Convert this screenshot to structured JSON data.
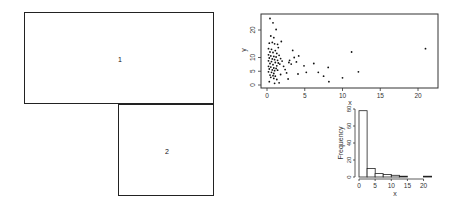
{
  "layout_panels": [
    {
      "label": "1",
      "x": 24,
      "y": 12,
      "w": 190,
      "h": 92
    },
    {
      "label": "2",
      "x": 118,
      "y": 104,
      "w": 96,
      "h": 92
    }
  ],
  "chart_data": [
    {
      "type": "scatter",
      "title": "",
      "xlabel": "x",
      "ylabel": "y",
      "xlim": [
        0,
        21
      ],
      "ylim": [
        0,
        24
      ],
      "xticks": [
        "0",
        "5",
        "10",
        "15",
        "20"
      ],
      "yticks": [
        "0",
        "5",
        "10",
        "20"
      ],
      "grid": false,
      "points": [
        [
          0.4,
          24.2
        ],
        [
          0.8,
          22.6
        ],
        [
          1.2,
          20.2
        ],
        [
          0.5,
          17.8
        ],
        [
          0.9,
          17.2
        ],
        [
          0.3,
          15.2
        ],
        [
          0.7,
          15.5
        ],
        [
          1.0,
          15.0
        ],
        [
          1.4,
          14.8
        ],
        [
          1.9,
          15.8
        ],
        [
          0.2,
          13.2
        ],
        [
          0.6,
          13.0
        ],
        [
          1.1,
          12.5
        ],
        [
          1.5,
          13.6
        ],
        [
          0.4,
          12.0
        ],
        [
          0.8,
          11.8
        ],
        [
          1.3,
          11.5
        ],
        [
          0.2,
          11.0
        ],
        [
          0.5,
          10.6
        ],
        [
          0.9,
          10.4
        ],
        [
          1.2,
          10.2
        ],
        [
          1.6,
          10.8
        ],
        [
          0.3,
          9.8
        ],
        [
          0.7,
          9.5
        ],
        [
          1.0,
          9.2
        ],
        [
          1.4,
          9.0
        ],
        [
          1.8,
          9.6
        ],
        [
          0.2,
          8.8
        ],
        [
          0.6,
          8.5
        ],
        [
          1.1,
          8.2
        ],
        [
          1.5,
          8.0
        ],
        [
          2.0,
          8.7
        ],
        [
          0.4,
          7.8
        ],
        [
          0.8,
          7.4
        ],
        [
          1.3,
          7.0
        ],
        [
          1.7,
          7.6
        ],
        [
          0.2,
          6.8
        ],
        [
          0.5,
          6.5
        ],
        [
          0.9,
          6.2
        ],
        [
          1.2,
          6.0
        ],
        [
          0.3,
          5.8
        ],
        [
          0.7,
          5.5
        ],
        [
          1.0,
          5.2
        ],
        [
          1.4,
          5.4
        ],
        [
          0.2,
          4.8
        ],
        [
          0.6,
          4.6
        ],
        [
          0.9,
          4.2
        ],
        [
          0.4,
          3.6
        ],
        [
          0.8,
          3.4
        ],
        [
          1.1,
          3.2
        ],
        [
          0.5,
          2.8
        ],
        [
          0.9,
          2.4
        ],
        [
          1.3,
          2.0
        ],
        [
          0.3,
          1.2
        ],
        [
          1.6,
          0.8
        ],
        [
          2.2,
          6.8
        ],
        [
          2.6,
          4.4
        ],
        [
          2.9,
          8.2
        ],
        [
          3.2,
          7.6
        ],
        [
          3.4,
          12.6
        ],
        [
          3.6,
          10.0
        ],
        [
          3.9,
          8.4
        ],
        [
          4.1,
          4.0
        ],
        [
          4.2,
          10.6
        ],
        [
          4.9,
          7.0
        ],
        [
          5.2,
          4.6
        ],
        [
          6.2,
          7.8
        ],
        [
          6.8,
          4.6
        ],
        [
          7.5,
          3.2
        ],
        [
          8.1,
          6.4
        ],
        [
          8.2,
          1.2
        ],
        [
          10.0,
          2.6
        ],
        [
          11.2,
          12.0
        ],
        [
          12.1,
          4.8
        ],
        [
          21.0,
          13.2
        ],
        [
          2.4,
          5.6
        ],
        [
          1.8,
          3.8
        ],
        [
          2.8,
          2.2
        ],
        [
          3.0,
          9.0
        ],
        [
          1.0,
          0.6
        ]
      ]
    },
    {
      "type": "bar",
      "subtype": "histogram",
      "title": "",
      "xlabel": "x",
      "ylabel": "Frequency",
      "xlim": [
        0,
        22
      ],
      "ylim": [
        0,
        80
      ],
      "xticks": [
        "0",
        "5",
        "10",
        "15",
        "20"
      ],
      "yticks": [
        "0",
        "20",
        "40",
        "60",
        "80"
      ],
      "bin_width": 2.5,
      "categories": [
        "0-2.5",
        "2.5-5",
        "5-7.5",
        "7.5-10",
        "10-12.5",
        "12.5-15",
        "15-17.5",
        "17.5-20",
        "20-22.5"
      ],
      "values": [
        78,
        10,
        4,
        3,
        2,
        1,
        0,
        0,
        1
      ]
    }
  ]
}
